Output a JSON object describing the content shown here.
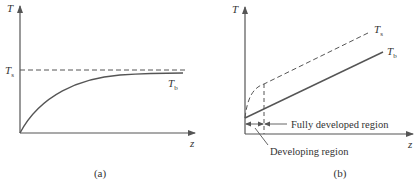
{
  "panel_a": {
    "caption": "(a)",
    "y_axis_label": "T",
    "x_axis_label": "z",
    "surface_temp_label": "T",
    "surface_temp_sub": "s",
    "bulk_temp_label": "T",
    "bulk_temp_sub": "b"
  },
  "panel_b": {
    "caption": "(b)",
    "y_axis_label": "T",
    "x_axis_label": "z",
    "surface_temp_label": "T",
    "surface_temp_sub": "s",
    "bulk_temp_label": "T",
    "bulk_temp_sub": "b",
    "fully_developed_label": "Fully developed region",
    "developing_label": "Developing region"
  },
  "colors": {
    "line": "#555555",
    "text": "#333333"
  }
}
